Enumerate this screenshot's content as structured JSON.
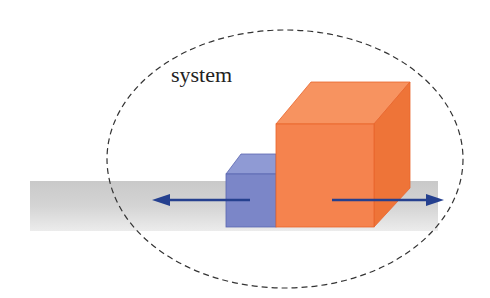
{
  "diagram": {
    "label": "system",
    "colors": {
      "floor": "#cfcfcf",
      "blue_front": "#7b86c8",
      "blue_top": "#8f9ad4",
      "blue_edge": "#5a66b0",
      "orange_front": "#f5834e",
      "orange_top": "#f79360",
      "orange_side": "#ee7438",
      "arrow": "#25408f",
      "boundary": "#333333"
    },
    "elements": [
      {
        "name": "floor",
        "type": "surface"
      },
      {
        "name": "small-block",
        "color": "blue"
      },
      {
        "name": "large-block",
        "color": "orange"
      },
      {
        "name": "left-arrow",
        "direction": "left",
        "on": "small-block"
      },
      {
        "name": "right-arrow",
        "direction": "right",
        "on": "large-block"
      },
      {
        "name": "system-boundary",
        "type": "dashed-ellipse"
      }
    ]
  }
}
